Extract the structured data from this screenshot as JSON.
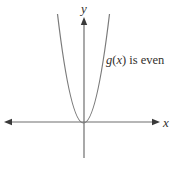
{
  "diagram": {
    "type": "function-graph",
    "y_axis_label": "y",
    "x_axis_label": "x",
    "annotation": {
      "func": "g",
      "open": "(",
      "var": "x",
      "close_rest": ") is even"
    },
    "colors": {
      "axis": "#6f6f6f",
      "curve": "#7a7a7a",
      "arrow": "#3a3a3a",
      "text": "#33302d",
      "background": "#ffffff"
    }
  }
}
